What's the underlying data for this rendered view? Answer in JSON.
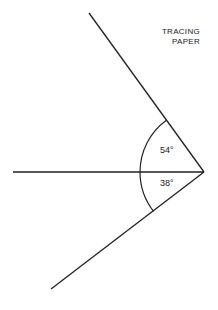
{
  "diagram": {
    "title_line1": "TRACING",
    "title_line2": "PAPER",
    "angles": [
      {
        "name": "upper-angle",
        "label": "54°",
        "degrees": 54
      },
      {
        "name": "lower-angle",
        "label": "38°",
        "degrees": 38
      }
    ],
    "vertex": [
      204,
      172
    ],
    "lines": {
      "upper_ray_end": [
        89,
        13
      ],
      "horizontal_end": [
        13,
        172
      ],
      "lower_ray_end": [
        51,
        289
      ]
    },
    "arc_radius": 64,
    "stroke_color": "#222222"
  }
}
